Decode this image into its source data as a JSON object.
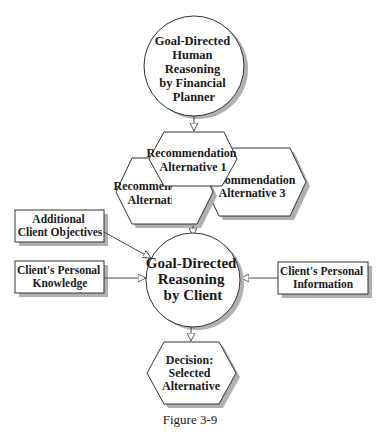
{
  "diagram": {
    "caption": "Figure 3-9",
    "colors": {
      "stroke": "#333333",
      "shadow": "#b0b0b0",
      "fill": "#ffffff",
      "text": "#1a1a1a"
    },
    "planner_circle": {
      "lines": [
        "Goal-Directed",
        "Human",
        "Reasoning",
        "by Financial",
        "Planner"
      ]
    },
    "alternatives": [
      {
        "lines": [
          "Recommendation",
          "Alternative 1"
        ]
      },
      {
        "lines": [
          "Recommendation",
          "Alternative 2"
        ]
      },
      {
        "lines": [
          "Recommendation",
          "Alternative 3"
        ]
      }
    ],
    "inputs": [
      {
        "lines": [
          "Additional",
          "Client Objectives"
        ]
      },
      {
        "lines": [
          "Client's Personal",
          "Knowledge"
        ]
      },
      {
        "lines": [
          "Client's Personal",
          "Information"
        ]
      }
    ],
    "client_circle": {
      "lines": [
        "Goal-Directed",
        "Reasoning",
        "by Client"
      ]
    },
    "decision": {
      "lines": [
        "Decision:",
        "Selected",
        "Alternative"
      ]
    }
  }
}
